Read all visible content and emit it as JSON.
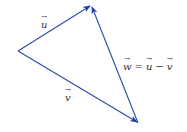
{
  "diagram": {
    "type": "vector-triangle",
    "stroke_color": "#2b4aa8",
    "arrow_color": "#1d3fa8",
    "points": {
      "origin": [
        18,
        51
      ],
      "u_tip": [
        91,
        5
      ],
      "v_tip": [
        138,
        123
      ]
    },
    "vectors": [
      {
        "name": "u",
        "from": "origin",
        "to": "u_tip",
        "label": "u"
      },
      {
        "name": "v",
        "from": "origin",
        "to": "v_tip",
        "label": "v"
      },
      {
        "name": "w",
        "from": "v_tip",
        "to": "u_tip",
        "label": "w"
      }
    ],
    "labels": {
      "u": "u",
      "v": "v",
      "w_equation": {
        "lhs": "w",
        "eq": "=",
        "a": "u",
        "minus": "−",
        "b": "v"
      }
    }
  }
}
